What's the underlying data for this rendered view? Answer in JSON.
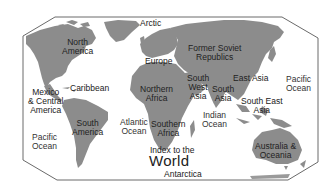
{
  "colors": {
    "land": "#8c8c8c",
    "frame": "#666666",
    "background": "#ffffff",
    "text": "#222222"
  },
  "title": {
    "prefix": "Index to the",
    "main": "World"
  },
  "regions": {
    "north_america": "North\nAmerica",
    "mexico_central_america": "Mexico\n& Central\nAmerica",
    "caribbean": "Caribbean",
    "south_america": "South\nAmerica",
    "europe": "Europe",
    "northern_africa": "Northern\nAfrica",
    "southern_africa": "Southern\nAfrica",
    "former_soviet_republics": "Former Soviet\nRepublics",
    "south_west_asia": "South\nWest\nAsia",
    "south_asia": "South\nAsia",
    "east_asia": "East Asia",
    "south_east_asia": "South East\nAsia",
    "australia_oceania": "Australia &\nOceania",
    "arctic": "Arctic",
    "antarctica": "Antarctica"
  },
  "oceans": {
    "pacific_east": "Pacific\nOcean",
    "pacific_west": "Pacific\nOcean",
    "atlantic": "Atlantic\nOcean",
    "indian": "Indian\nOcean"
  }
}
